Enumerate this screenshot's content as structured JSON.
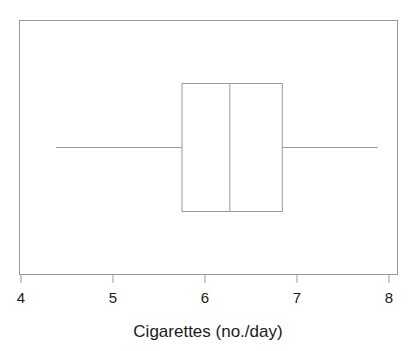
{
  "chart_data": {
    "type": "box",
    "title": "",
    "xlabel": "Cigarettes (no./day)",
    "ylabel": "",
    "xlim": [
      3.78,
      7.98
    ],
    "xticks": [
      4,
      5,
      6,
      7,
      8
    ],
    "xticklabels": [
      "4",
      "5",
      "6",
      "7",
      "8"
    ],
    "grid": false,
    "legend": null,
    "orientation": "horizontal",
    "boxes": [
      {
        "name": "Cigarettes (no./day)",
        "whisker_low": 4.38,
        "q1": 5.75,
        "median": 6.27,
        "q3": 6.84,
        "whisker_high": 7.88,
        "outliers": [],
        "caps": false
      }
    ],
    "colors": {
      "line": "#999999",
      "box_fill": "none",
      "frame": "#999999",
      "text": "#1a1a1a",
      "background": "#ffffff"
    }
  },
  "axis": {
    "label": "Cigarettes (no./day)",
    "tick_labels": [
      "4",
      "5",
      "6",
      "7",
      "8"
    ]
  }
}
